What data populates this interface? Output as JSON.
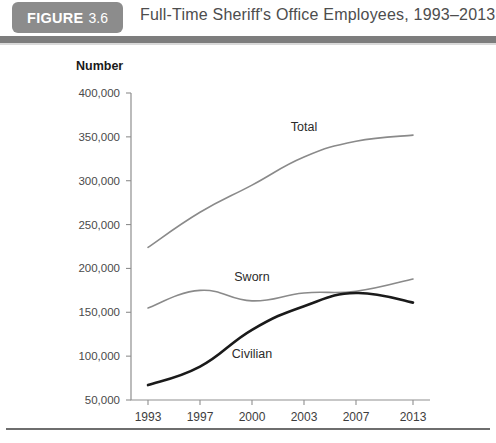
{
  "header": {
    "badge_label": "FIGURE",
    "badge_number": "3.6",
    "title": "Full-Time Sheriff's Office Employees, 1993–2013",
    "badge_color": "#8c8c8c",
    "rule_color": "#7d7d7d"
  },
  "chart_data": {
    "type": "line",
    "title": "Full-Time Sheriff's Office Employees, 1993–2013",
    "xlabel": "",
    "ylabel": "Number",
    "categories": [
      "1993",
      "1997",
      "2000",
      "2003",
      "2007",
      "2013"
    ],
    "ylim": [
      50000,
      400000
    ],
    "ytick_labels": [
      "50,000",
      "100,000",
      "150,000",
      "200,000",
      "250,000",
      "300,000",
      "350,000",
      "400,000"
    ],
    "ytick_values": [
      50000,
      100000,
      150000,
      200000,
      250000,
      300000,
      350000,
      400000
    ],
    "grid": false,
    "legend_position": "inline-annotations",
    "series": [
      {
        "name": "Total",
        "color": "#8a8a8a",
        "width": 1.6,
        "values": [
          224000,
          264000,
          295000,
          327000,
          345000,
          352000
        ],
        "label_x_index": 3,
        "label_offset_y": -26
      },
      {
        "name": "Sworn",
        "color": "#8a8a8a",
        "width": 1.6,
        "values": [
          155000,
          175000,
          163000,
          172000,
          174000,
          188000
        ],
        "label_x_index": 2,
        "label_offset_y": -20
      },
      {
        "name": "Civilian",
        "color": "#1a1a1a",
        "width": 2.6,
        "values": [
          67000,
          88000,
          130000,
          157000,
          172000,
          161000
        ],
        "label_x_index": 2,
        "label_offset_y": 28
      }
    ]
  }
}
